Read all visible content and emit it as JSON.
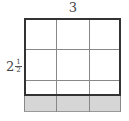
{
  "diagram": {
    "top_label": "3",
    "side_label": {
      "whole": "2",
      "numerator": "1",
      "denominator": "2"
    },
    "grid": {
      "columns": 3,
      "rows_in_outlined_region": 3,
      "shaded_rows_below": 1,
      "shade_color": "#d6d6d6",
      "outline_color": "#333333"
    }
  }
}
